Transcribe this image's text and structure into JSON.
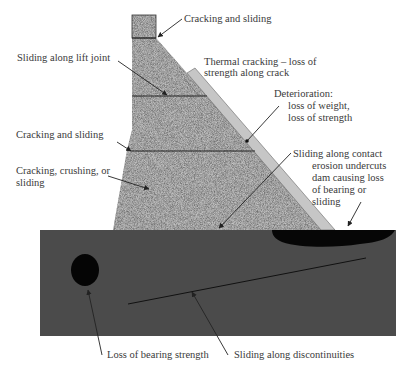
{
  "colors": {
    "concrete_base": "#9a9a9a",
    "face_strip": "#c4c4c4",
    "foundation": "#4a4a4a",
    "void": "#050505",
    "line": "#222222",
    "text": "#3a3a3a"
  },
  "labels": {
    "crest": "Cracking and sliding",
    "lift_joint": "Sliding along lift joint",
    "thermal_1": "Thermal cracking – loss of",
    "thermal_2": "strength along crack",
    "deterioration_1": "Deterioration:",
    "deterioration_2": "loss of weight,",
    "deterioration_3": "loss of strength",
    "mid_joint": "Cracking and sliding",
    "lower_1": "Cracking, crushing, or",
    "lower_2": "sliding",
    "contact": "Sliding along contact",
    "erosion_1": "erosion undercuts",
    "erosion_2": "dam causing loss",
    "erosion_3": "of bearing or",
    "erosion_4": "sliding",
    "bearing": "Loss of bearing strength",
    "discontinuities": "Sliding along discontinuities"
  }
}
